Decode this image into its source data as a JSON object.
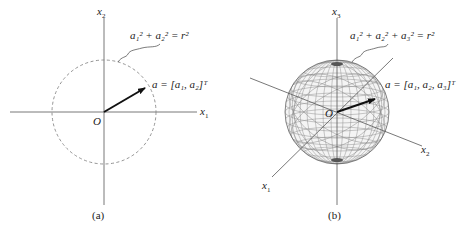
{
  "panel_a": {
    "caption": "(a)",
    "axis_x_label": "x",
    "axis_x_sub": "1",
    "axis_y_label": "x",
    "axis_y_sub": "2",
    "origin_label": "O",
    "circle_equation": "a₁² + a₂² = r²",
    "vector_label": "a = [a₁, a₂]ᵀ",
    "circle_style": "dashed"
  },
  "panel_b": {
    "caption": "(b)",
    "axis_1_label": "x",
    "axis_1_sub": "1",
    "axis_2_label": "x",
    "axis_2_sub": "2",
    "axis_3_label": "x",
    "axis_3_sub": "3",
    "origin_label": "O",
    "sphere_equation": "a₁² + a₂² + a₃² = r²",
    "vector_label": "a = [a₁, a₂, a₃]ᵀ",
    "sphere_style": "wireframe"
  },
  "colors": {
    "line": "#444444",
    "dashed_circle": "#888888",
    "wireframe": "#777777",
    "vector": "#111111"
  }
}
